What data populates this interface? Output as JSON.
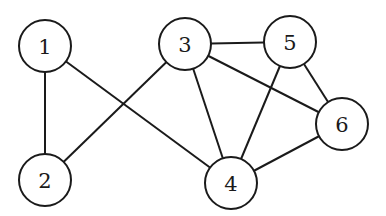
{
  "graph": {
    "nodes": [
      {
        "id": "1",
        "label": "1",
        "x": 45,
        "y": 46
      },
      {
        "id": "2",
        "label": "2",
        "x": 45,
        "y": 180
      },
      {
        "id": "3",
        "label": "3",
        "x": 185,
        "y": 44
      },
      {
        "id": "4",
        "label": "4",
        "x": 231,
        "y": 183
      },
      {
        "id": "5",
        "label": "5",
        "x": 290,
        "y": 42
      },
      {
        "id": "6",
        "label": "6",
        "x": 342,
        "y": 124
      }
    ],
    "edges": [
      {
        "from": "1",
        "to": "2"
      },
      {
        "from": "1",
        "to": "4"
      },
      {
        "from": "2",
        "to": "3"
      },
      {
        "from": "3",
        "to": "5"
      },
      {
        "from": "3",
        "to": "4"
      },
      {
        "from": "3",
        "to": "6"
      },
      {
        "from": "5",
        "to": "4"
      },
      {
        "from": "5",
        "to": "6"
      },
      {
        "from": "4",
        "to": "6"
      }
    ],
    "node_radius": 26,
    "colors": {
      "stroke": "#1a1a1a",
      "fill": "#ffffff"
    }
  }
}
